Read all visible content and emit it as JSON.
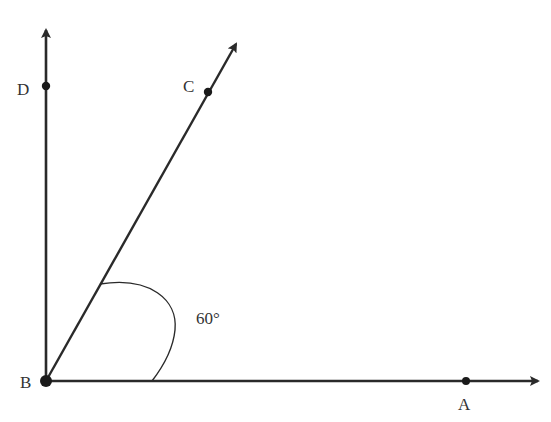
{
  "diagram": {
    "type": "geometry-angles",
    "points": {
      "B": {
        "label": "B",
        "x": 46,
        "y": 381
      },
      "A": {
        "label": "A",
        "x": 466,
        "y": 381
      },
      "C": {
        "label": "C",
        "x": 208,
        "y": 92
      },
      "D": {
        "label": "D",
        "x": 46,
        "y": 86
      }
    },
    "rays": [
      {
        "name": "BA",
        "from": "B",
        "through": "A"
      },
      {
        "name": "BC",
        "from": "B",
        "through": "C"
      },
      {
        "name": "BD",
        "from": "B",
        "through": "D"
      }
    ],
    "angle_label": "60°",
    "angle_between": [
      "BA",
      "BC"
    ],
    "colors": {
      "line": "#2a2a2a",
      "text": "#333333",
      "background": "#ffffff"
    }
  }
}
